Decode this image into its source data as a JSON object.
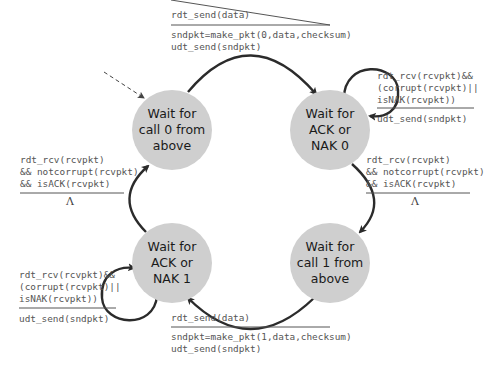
{
  "diagram": {
    "states": [
      {
        "id": "wait-call-0",
        "lines": [
          "Wait for",
          "call 0 from",
          "above"
        ],
        "cx": 172,
        "cy": 130
      },
      {
        "id": "wait-ack-nak-0",
        "lines": [
          "Wait for",
          "ACK or",
          "NAK 0"
        ],
        "cx": 330,
        "cy": 130
      },
      {
        "id": "wait-call-1",
        "lines": [
          "Wait for",
          "call 1 from",
          "above"
        ],
        "cx": 330,
        "cy": 263
      },
      {
        "id": "wait-ack-nak-1",
        "lines": [
          "Wait for",
          "ACK or",
          "NAK 1"
        ],
        "cx": 172,
        "cy": 263
      }
    ],
    "transitions": {
      "top": {
        "event": [
          "rdt_send(data)"
        ],
        "actions": [
          "sndpkt=make_pkt(0,data,checksum)",
          "udt_send(sndpkt)"
        ]
      },
      "right_loop": {
        "event": [
          "rdt_rcv(rcvpkt)&&",
          "(corrupt(rcvpkt)||",
          "isNAK(rcvpkt))"
        ],
        "actions": [
          "udt_send(sndpkt)"
        ]
      },
      "right": {
        "event": [
          "rdt_rcv(rcvpkt)",
          "&& notcorrupt(rcvpkt)",
          "&& isACK(rcvpkt)"
        ],
        "actions": [
          "Λ"
        ]
      },
      "bottom": {
        "event": [
          "rdt_send(data)"
        ],
        "actions": [
          "sndpkt=make_pkt(1,data,checksum)",
          "udt_send(sndpkt)"
        ]
      },
      "left_loop": {
        "event": [
          "rdt_rcv(rcvpkt)&&",
          "(corrupt(rcvpkt)||",
          "isNAK(rcvpkt))"
        ],
        "actions": [
          "udt_send(sndpkt)"
        ]
      },
      "left": {
        "event": [
          "rdt_rcv(rcvpkt)",
          "&& notcorrupt(rcvpkt)",
          "&& isACK(rcvpkt)"
        ],
        "actions": [
          "Λ"
        ]
      }
    },
    "colors": {
      "state_fill": "#cfcfcf",
      "arrow": "#2b2b2b",
      "text": "#555555"
    }
  }
}
